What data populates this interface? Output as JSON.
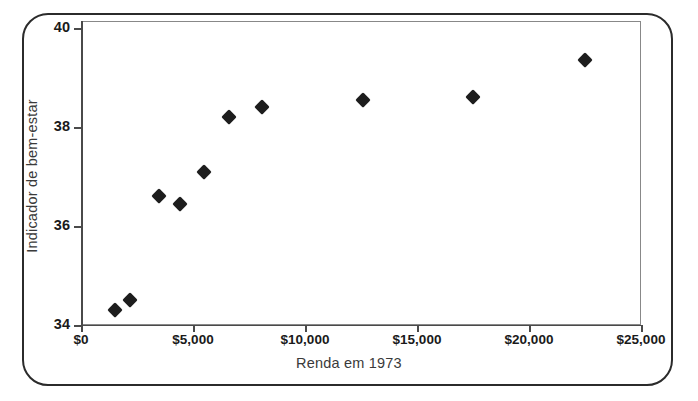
{
  "chart_data": {
    "type": "scatter",
    "title": "",
    "xlabel": "Renda em 1973",
    "ylabel": "Indicador de bem-estar",
    "xlim": [
      0,
      25000
    ],
    "ylim": [
      34,
      40
    ],
    "grid": false,
    "legend": null,
    "xticks": [
      {
        "value": 0,
        "label": "$0"
      },
      {
        "value": 5000,
        "label": "$5,000"
      },
      {
        "value": 10000,
        "label": "$10,000"
      },
      {
        "value": 15000,
        "label": "$15,000"
      },
      {
        "value": 20000,
        "label": "$20,000"
      },
      {
        "value": 25000,
        "label": "$25,000"
      }
    ],
    "yticks": [
      {
        "value": 34,
        "label": "34"
      },
      {
        "value": 36,
        "label": "36"
      },
      {
        "value": 38,
        "label": "38"
      },
      {
        "value": 40,
        "label": "40"
      }
    ],
    "marker": "diamond",
    "marker_color": "#1d1d1d",
    "points": [
      {
        "x": 1500,
        "y": 34.3
      },
      {
        "x": 2200,
        "y": 34.5
      },
      {
        "x": 3500,
        "y": 36.6
      },
      {
        "x": 4400,
        "y": 36.45
      },
      {
        "x": 5500,
        "y": 37.1
      },
      {
        "x": 6600,
        "y": 38.2
      },
      {
        "x": 8100,
        "y": 38.4
      },
      {
        "x": 12600,
        "y": 38.55
      },
      {
        "x": 17500,
        "y": 38.6
      },
      {
        "x": 22500,
        "y": 39.35
      }
    ]
  }
}
